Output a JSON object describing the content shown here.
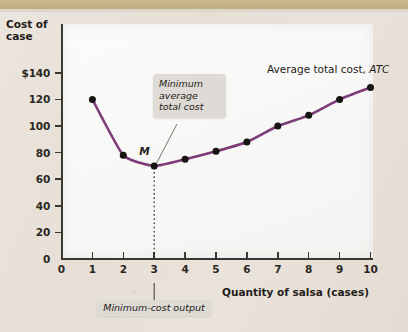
{
  "chart_data": {
    "type": "line",
    "title": "",
    "xlabel": "Quantity of salsa (cases)",
    "ylabel_line1": "Cost of",
    "ylabel_line2": "case",
    "xlim": [
      0,
      10.6
    ],
    "ylim": [
      0,
      150
    ],
    "grid": false,
    "x": [
      1,
      2,
      3,
      4,
      5,
      6,
      7,
      8,
      9,
      10
    ],
    "series": [
      {
        "name": "Average total cost, ATC",
        "values": [
          120,
          78,
          70,
          75,
          81,
          88,
          100,
          108,
          120,
          129
        ],
        "color": "#7d3b78",
        "marker": "circle",
        "marker_color": "#161412"
      }
    ],
    "xticks": [
      0,
      1,
      2,
      3,
      4,
      5,
      6,
      7,
      8,
      9,
      10
    ],
    "xticklabels": [
      "0",
      "1",
      "2",
      "3",
      "4",
      "5",
      "6",
      "7",
      "8",
      "9",
      "10"
    ],
    "yticks": [
      0,
      20,
      40,
      60,
      80,
      100,
      120,
      140
    ],
    "yticklabels": [
      "0",
      "20",
      "40",
      "60",
      "80",
      "100",
      "120",
      "$140"
    ],
    "annotations": [
      {
        "name": "minimum-average-total-cost-callout",
        "text_line1": "Minimum",
        "text_line2": "average",
        "text_line3": "total cost",
        "points_to_x": 3,
        "points_to_y": 70
      },
      {
        "name": "minimum-cost-output-callout",
        "text": "Minimum-cost output",
        "points_to_x": 3
      },
      {
        "name": "curve-label",
        "text_plain": "Average total cost, ",
        "text_italic": "ATC"
      },
      {
        "name": "minimum-point-label",
        "text": "M",
        "at_x": 3,
        "at_y": 70
      }
    ],
    "legend_position": "inline-curve-label"
  },
  "colors": {
    "curve": "#7d3b78",
    "marker": "#161412",
    "axis": "#3a3632",
    "plot_background": "#f9f9f8",
    "page_background": "#e9e2da",
    "callout_background": "#dedad5",
    "top_band": "#c5b384"
  }
}
